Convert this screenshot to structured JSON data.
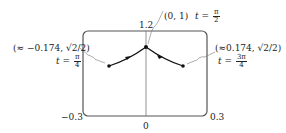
{
  "figure": {
    "axes": {
      "y_top_label": "1.2",
      "x_left_label": "−0.3",
      "x_right_label": "0.3",
      "x_center_label": "0"
    },
    "points": {
      "top": {
        "coord": "(0, 1)",
        "t_var": "t =",
        "t_num": "π",
        "t_den": "2"
      },
      "left": {
        "coord": "(≈ −0.174, √2/2)",
        "t_var": "t =",
        "t_num": "π",
        "t_den": "4"
      },
      "right": {
        "coord": "(≈0.174, √2/2)",
        "t_var": "t =",
        "t_num": "3π",
        "t_den": "4"
      }
    },
    "colors": {
      "curve": "#111111",
      "frame": "#555555",
      "leader": "#777777"
    }
  }
}
